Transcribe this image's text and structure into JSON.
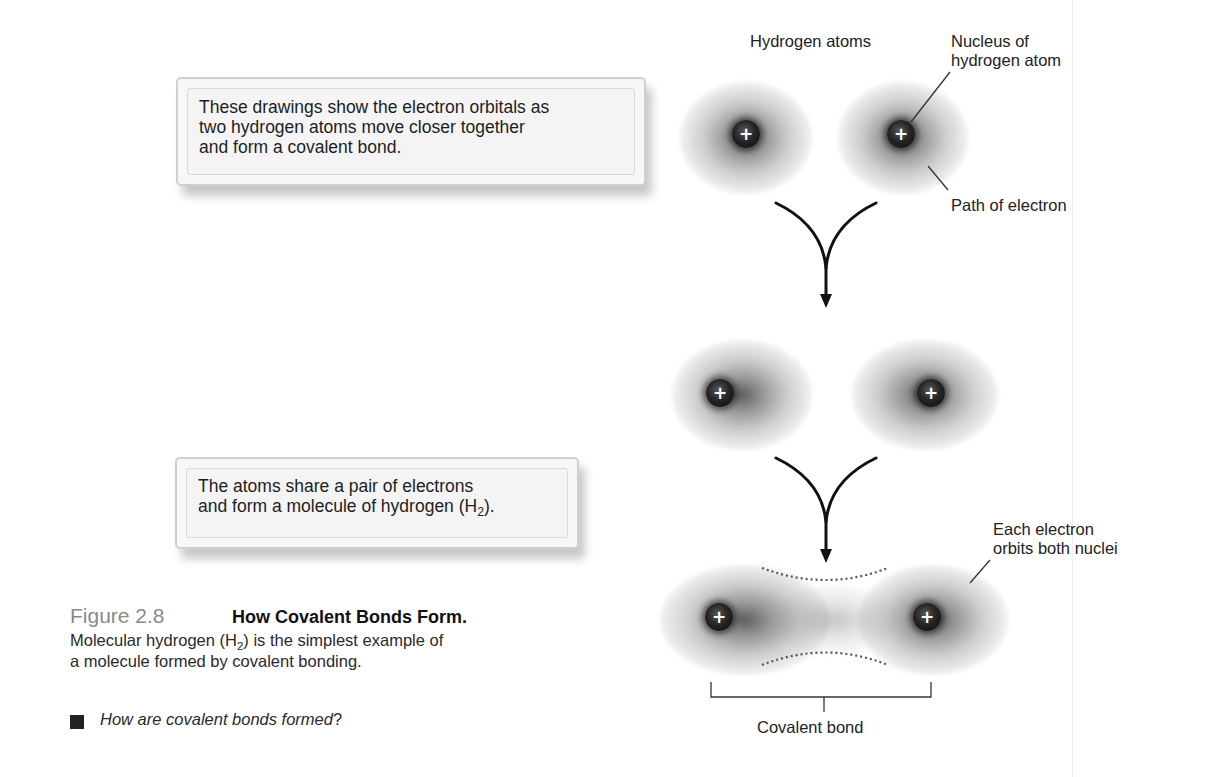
{
  "callouts": {
    "top": {
      "text": "These drawings show the electron orbitals as\ntwo hydrogen atoms move closer together\nand form a covalent bond."
    },
    "bottom": {
      "line1": "The atoms share a pair of electrons",
      "line2_prefix": "and form a molecule of hydrogen (H",
      "line2_sub": "2",
      "line2_suffix": ")."
    }
  },
  "labels": {
    "hydrogen_atoms": "Hydrogen atoms",
    "nucleus": "Nucleus of\nhydrogen atom",
    "path_of_electron": "Path of electron",
    "each_electron": "Each electron\norbits both nuclei",
    "covalent_bond": "Covalent bond"
  },
  "atoms": {
    "symbol": "+",
    "stages": [
      {
        "name": "separate",
        "left_x": 746,
        "right_x": 901,
        "y": 134
      },
      {
        "name": "approaching",
        "left_x": 720,
        "right_x": 931,
        "y": 393
      },
      {
        "name": "bonded",
        "left_x": 719,
        "right_x": 927,
        "y": 617
      }
    ]
  },
  "caption": {
    "figure_number": "Figure 2.8",
    "title": "How Covalent Bonds Form.",
    "body_line1_prefix": "Molecular hydrogen (H",
    "body_line1_sub": "2",
    "body_line1_suffix": ") is the simplest example of",
    "body_line2": "a molecule formed by covalent bonding.",
    "question_prefix": "How are covalent bonds formed",
    "question_suffix": "?"
  },
  "colors": {
    "figure_number": "#8a8a8a",
    "text": "#1a1a1a",
    "callout_bg": "#f5f5f5",
    "nucleus": "#111111"
  }
}
